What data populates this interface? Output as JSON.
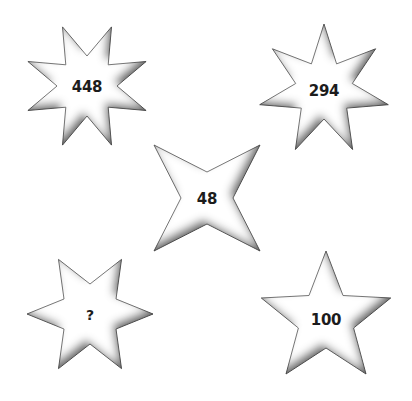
{
  "puzzle": {
    "stars": [
      {
        "id": "star-8",
        "points": 8,
        "label": "448",
        "cx": 87,
        "cy": 86,
        "outer": 64,
        "inner": 30,
        "rotation": -22.5
      },
      {
        "id": "star-7",
        "points": 7,
        "label": "294",
        "cx": 324,
        "cy": 90,
        "outer": 66,
        "inner": 29,
        "rotation": 0
      },
      {
        "id": "star-4",
        "points": 4,
        "label": "48",
        "cx": 207,
        "cy": 198,
        "outer": 75,
        "inner": 26,
        "rotation": 45
      },
      {
        "id": "star-6",
        "points": 6,
        "label": "?",
        "cx": 90,
        "cy": 314,
        "outer": 63,
        "inner": 30,
        "rotation": 30
      },
      {
        "id": "star-5",
        "points": 5,
        "label": "100",
        "cx": 326,
        "cy": 319,
        "outer": 68,
        "inner": 29,
        "rotation": 0
      }
    ],
    "colors": {
      "fill": "#ffffff",
      "stroke": "#6a6a6a",
      "shadow": "#3a3a3a",
      "text": "#1c1c1c",
      "background": "#ffffff"
    }
  }
}
